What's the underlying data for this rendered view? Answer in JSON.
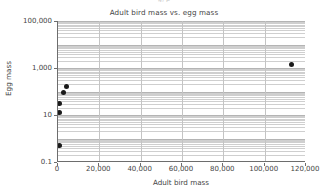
{
  "top_fragment": "g, p",
  "chart_data": {
    "type": "scatter",
    "title": "Adult bird mass vs. egg mass",
    "xlabel": "Adult bird mass",
    "ylabel": "Egg mass",
    "xlim": [
      0,
      120000
    ],
    "ylim": [
      0.1,
      100000
    ],
    "yscale": "log",
    "xscale": "linear",
    "grid": true,
    "minor_grid": true,
    "legend": "none",
    "xticks": [
      0,
      20000,
      40000,
      60000,
      80000,
      100000,
      120000
    ],
    "xticklabels": [
      "0",
      "20,000",
      "40,000",
      "60,000",
      "80,000",
      "100,000",
      "120,000"
    ],
    "yticks": [
      0.1,
      10,
      1000,
      100000
    ],
    "yticklabels": [
      "0.1",
      "10",
      "1,000",
      "100,000"
    ],
    "points": [
      {
        "x": 113000,
        "y": 1400
      },
      {
        "x": 4300,
        "y": 160
      },
      {
        "x": 2700,
        "y": 92
      },
      {
        "x": 900,
        "y": 32
      },
      {
        "x": 700,
        "y": 13
      },
      {
        "x": 600,
        "y": 0.5
      }
    ]
  }
}
